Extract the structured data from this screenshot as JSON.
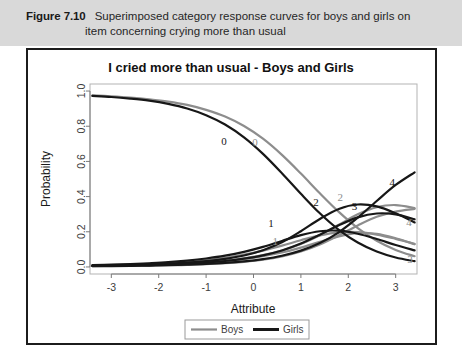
{
  "caption": {
    "figure_number": "Figure 7.10",
    "line1": "Superimposed category response curves for boys and girls on",
    "line2": "item concerning crying more than usual"
  },
  "colors": {
    "boys": "#8d8d8d",
    "girls": "#171717",
    "caption_band": "#d9d9d9",
    "figure_border": "#1c1c1c",
    "plot_frame": "#b3b3b3"
  },
  "chart_data": {
    "type": "line",
    "title": "I cried more than usual - Boys and Girls",
    "xlabel": "Attribute",
    "ylabel": "Probability",
    "xlim": [
      -3.45,
      3.45
    ],
    "ylim": [
      -0.04,
      1.04
    ],
    "xticks": [
      "-3",
      "-2",
      "-1",
      "0",
      "1",
      "2",
      "3"
    ],
    "xtick_values": [
      -3,
      -2,
      -1,
      0,
      1,
      2,
      3
    ],
    "yticks": [
      "0.0",
      "0.2",
      "0.4",
      "0.6",
      "0.8",
      "1.0"
    ],
    "ytick_values": [
      0.0,
      0.2,
      0.4,
      0.6,
      0.8,
      1.0
    ],
    "grid": false,
    "legend_position": "bottom",
    "legend": [
      {
        "name": "Boys",
        "color": "#8d8d8d"
      },
      {
        "name": "Girls",
        "color": "#171717"
      }
    ],
    "x": [
      -3.4,
      -3.0,
      -2.6,
      -2.2,
      -1.8,
      -1.4,
      -1.0,
      -0.6,
      -0.2,
      0.2,
      0.6,
      1.0,
      1.4,
      1.8,
      2.2,
      2.6,
      3.0,
      3.4
    ],
    "series": [
      {
        "name": "Boys 0",
        "group": "Boys",
        "category": "0",
        "color": "#8d8d8d",
        "values": [
          0.975,
          0.97,
          0.963,
          0.953,
          0.94,
          0.921,
          0.893,
          0.855,
          0.801,
          0.729,
          0.637,
          0.531,
          0.419,
          0.313,
          0.221,
          0.149,
          0.097,
          0.061
        ],
        "label": {
          "text": "0",
          "x": 0.03,
          "y": 0.69
        }
      },
      {
        "name": "Boys 1",
        "group": "Boys",
        "category": "1",
        "color": "#8d8d8d",
        "values": [
          0.008,
          0.01,
          0.013,
          0.017,
          0.022,
          0.029,
          0.039,
          0.052,
          0.07,
          0.093,
          0.121,
          0.152,
          0.18,
          0.197,
          0.198,
          0.184,
          0.16,
          0.132
        ],
        "label": {
          "text": "1",
          "x": 0.46,
          "y": 0.125
        }
      },
      {
        "name": "Boys 2",
        "group": "Boys",
        "category": "2",
        "color": "#8d8d8d",
        "values": [
          0.006,
          0.007,
          0.009,
          0.012,
          0.015,
          0.02,
          0.027,
          0.036,
          0.049,
          0.067,
          0.093,
          0.13,
          0.18,
          0.24,
          0.299,
          0.34,
          0.352,
          0.335
        ],
        "label": {
          "text": "2",
          "x": 1.83,
          "y": 0.375
        }
      },
      {
        "name": "Boys 3",
        "group": "Boys",
        "category": "3",
        "color": "#8d8d8d",
        "values": [
          0.006,
          0.007,
          0.009,
          0.011,
          0.014,
          0.019,
          0.025,
          0.033,
          0.045,
          0.061,
          0.082,
          0.11,
          0.143,
          0.174,
          0.192,
          0.188,
          0.163,
          0.129
        ],
        "label": {
          "text": "3",
          "x": 3.3,
          "y": 0.02
        }
      },
      {
        "name": "Boys 4",
        "group": "Boys",
        "category": "4",
        "color": "#8d8d8d",
        "values": [
          0.005,
          0.006,
          0.007,
          0.008,
          0.01,
          0.012,
          0.016,
          0.021,
          0.029,
          0.041,
          0.06,
          0.088,
          0.128,
          0.18,
          0.236,
          0.285,
          0.315,
          0.33
        ],
        "label": {
          "text": "4",
          "x": 3.28,
          "y": 0.235
        }
      },
      {
        "name": "Girls 0",
        "group": "Girls",
        "category": "0",
        "color": "#171717",
        "values": [
          0.972,
          0.966,
          0.957,
          0.945,
          0.927,
          0.901,
          0.863,
          0.81,
          0.737,
          0.643,
          0.533,
          0.416,
          0.305,
          0.211,
          0.139,
          0.088,
          0.054,
          0.033
        ],
        "label": {
          "text": "0",
          "x": -0.62,
          "y": 0.695
        }
      },
      {
        "name": "Girls 1",
        "group": "Girls",
        "category": "1",
        "color": "#171717",
        "values": [
          0.01,
          0.013,
          0.016,
          0.021,
          0.027,
          0.036,
          0.048,
          0.064,
          0.086,
          0.114,
          0.148,
          0.181,
          0.203,
          0.206,
          0.189,
          0.159,
          0.125,
          0.094
        ],
        "label": {
          "text": "1",
          "x": 0.37,
          "y": 0.225
        }
      },
      {
        "name": "Girls 2",
        "group": "Girls",
        "category": "2",
        "color": "#171717",
        "values": [
          0.007,
          0.009,
          0.011,
          0.014,
          0.019,
          0.025,
          0.033,
          0.046,
          0.065,
          0.095,
          0.14,
          0.203,
          0.273,
          0.33,
          0.355,
          0.344,
          0.305,
          0.253
        ],
        "label": {
          "text": "2",
          "x": 1.32,
          "y": 0.345
        }
      },
      {
        "name": "Girls 3",
        "group": "Girls",
        "category": "3",
        "color": "#171717",
        "values": [
          0.006,
          0.007,
          0.009,
          0.011,
          0.014,
          0.019,
          0.025,
          0.034,
          0.047,
          0.066,
          0.094,
          0.133,
          0.183,
          0.237,
          0.282,
          0.304,
          0.299,
          0.271
        ],
        "label": {
          "text": "3",
          "x": 2.13,
          "y": 0.325
        }
      },
      {
        "name": "Girls 4",
        "group": "Girls",
        "category": "4",
        "color": "#171717",
        "values": [
          0.005,
          0.005,
          0.006,
          0.008,
          0.01,
          0.013,
          0.017,
          0.023,
          0.032,
          0.045,
          0.064,
          0.093,
          0.136,
          0.197,
          0.28,
          0.375,
          0.466,
          0.538
        ],
        "label": {
          "text": "4",
          "x": 2.93,
          "y": 0.46
        }
      }
    ]
  }
}
